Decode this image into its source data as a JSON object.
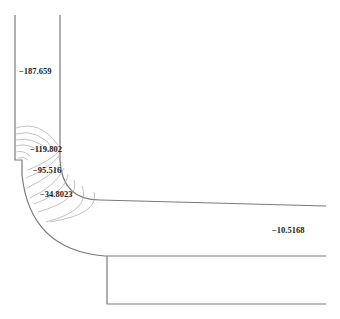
{
  "figure": {
    "type": "contour_plot",
    "labels": [
      {
        "id": "inlet",
        "text": "−187.659",
        "x": 19,
        "y": 66
      },
      {
        "id": "corner-inner",
        "text": "−119.802",
        "x": 30,
        "y": 145
      },
      {
        "id": "corner-mid",
        "text": "−95.516",
        "x": 33,
        "y": 166
      },
      {
        "id": "corner-outer",
        "text": "−34.8023",
        "x": 40,
        "y": 190
      },
      {
        "id": "outlet",
        "text": "−10.5168",
        "x": 272,
        "y": 226
      }
    ]
  }
}
